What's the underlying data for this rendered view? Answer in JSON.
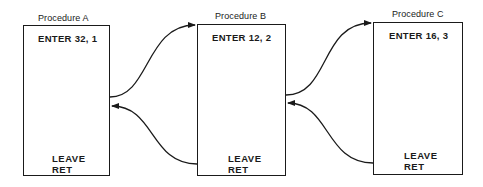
{
  "procedures": [
    {
      "title": "Procedure A",
      "enter": "ENTER 32, 1",
      "leave": "LEAVE",
      "ret": "RET"
    },
    {
      "title": "Procedure B",
      "enter": "ENTER 12, 2",
      "leave": "LEAVE",
      "ret": "RET"
    },
    {
      "title": "Procedure C",
      "enter": "ENTER 16, 3",
      "leave": "LEAVE",
      "ret": "RET"
    }
  ],
  "arrows": [
    {
      "from": "Procedure A",
      "to": "Procedure B",
      "kind": "call"
    },
    {
      "from": "Procedure B",
      "to": "Procedure A",
      "kind": "return"
    },
    {
      "from": "Procedure B",
      "to": "Procedure C",
      "kind": "call"
    },
    {
      "from": "Procedure C",
      "to": "Procedure B",
      "kind": "return"
    }
  ]
}
